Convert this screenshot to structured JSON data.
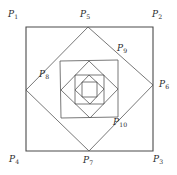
{
  "figure": {
    "canvas": {
      "width": 177,
      "height": 175
    },
    "stroke_color": "#555555",
    "outer_stroke_color": "#4a4a4a",
    "label_color": "#2b2b2b",
    "background_color": "#ffffff",
    "inscribe_ratio": 0.49,
    "squares": [
      {
        "name": "square-1-outer",
        "vertices": [
          [
            26,
            27
          ],
          [
            153,
            27
          ],
          [
            153,
            151
          ],
          [
            26,
            151
          ]
        ],
        "stroke_width": 1.1
      },
      {
        "name": "square-2",
        "vertices": [
          [
            88,
            27
          ],
          [
            153,
            85
          ],
          [
            89,
            151
          ],
          [
            26,
            90
          ]
        ],
        "stroke_width": 0.8
      },
      {
        "name": "square-3",
        "vertices": [
          [
            118,
            60
          ],
          [
            118,
            117
          ],
          [
            61,
            118
          ],
          [
            60,
            61
          ]
        ],
        "stroke_width": 0.8
      },
      {
        "name": "square-4",
        "vertices": [
          [
            118,
            89
          ],
          [
            90,
            118
          ],
          [
            61,
            90
          ],
          [
            89,
            61
          ]
        ],
        "stroke_width": 0.8
      },
      {
        "name": "square-5",
        "vertices": [
          [
            104,
            104
          ],
          [
            75,
            104
          ],
          [
            75,
            75
          ],
          [
            104,
            75
          ]
        ],
        "stroke_width": 0.8
      },
      {
        "name": "square-6",
        "vertices": [
          [
            90,
            104
          ],
          [
            75,
            90
          ],
          [
            89,
            75
          ],
          [
            104,
            89
          ]
        ],
        "stroke_width": 0.8
      },
      {
        "name": "square-7",
        "vertices": [
          [
            97,
            97
          ],
          [
            82,
            97
          ],
          [
            82,
            82
          ],
          [
            97,
            82
          ]
        ],
        "stroke_width": 0.8
      }
    ],
    "labels": [
      {
        "name": "label-p1",
        "base": "P",
        "sub": "1",
        "x": 8,
        "y": 10
      },
      {
        "name": "label-p2",
        "base": "P",
        "sub": "2",
        "x": 152,
        "y": 10
      },
      {
        "name": "label-p3",
        "base": "P",
        "sub": "3",
        "x": 153,
        "y": 155
      },
      {
        "name": "label-p4",
        "base": "P",
        "sub": "4",
        "x": 9,
        "y": 155
      },
      {
        "name": "label-p5",
        "base": "P",
        "sub": "5",
        "x": 80,
        "y": 10
      },
      {
        "name": "label-p6",
        "base": "P",
        "sub": "6",
        "x": 159,
        "y": 80
      },
      {
        "name": "label-p7",
        "base": "P",
        "sub": "7",
        "x": 83,
        "y": 156
      },
      {
        "name": "label-p8",
        "base": "P",
        "sub": "8",
        "x": 39,
        "y": 70
      },
      {
        "name": "label-p9",
        "base": "P",
        "sub": "9",
        "x": 117,
        "y": 44
      },
      {
        "name": "label-p10",
        "base": "P",
        "sub": "10",
        "x": 113,
        "y": 118
      }
    ]
  }
}
